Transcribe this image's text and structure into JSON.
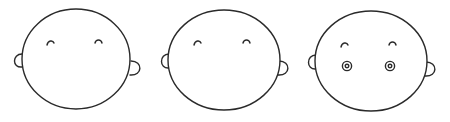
{
  "colors": {
    "background": "#ffffff",
    "stroke": "#2a2a2a"
  },
  "faces": [
    {
      "label": "Face 1",
      "features": [
        "head-outline",
        "left-ear",
        "right-ear",
        "left-eyebrow",
        "right-eyebrow"
      ],
      "cx": 76,
      "cy": 59,
      "rx": 54,
      "ry": 50,
      "has_eyes": false
    },
    {
      "label": "Face 2",
      "features": [
        "head-outline",
        "left-ear",
        "right-ear",
        "left-eyebrow",
        "right-eyebrow"
      ],
      "cx": 224,
      "cy": 60,
      "rx": 56,
      "ry": 50,
      "has_eyes": false
    },
    {
      "label": "Face 3",
      "features": [
        "head-outline",
        "left-ear",
        "right-ear",
        "left-eyebrow",
        "right-eyebrow",
        "left-eye",
        "right-eye"
      ],
      "cx": 371,
      "cy": 61,
      "rx": 56,
      "ry": 50,
      "has_eyes": true,
      "eye_style": "concentric circles"
    }
  ]
}
